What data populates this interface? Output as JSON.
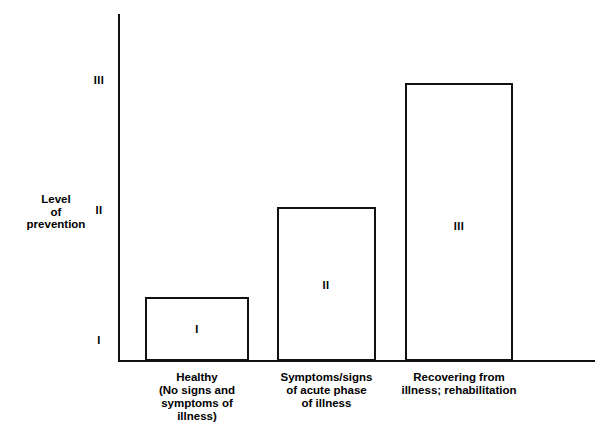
{
  "chart_data": {
    "type": "bar",
    "title": "",
    "subtitle": "",
    "xlabel": "",
    "ylabel": "Level of prevention",
    "ylabel_lines": [
      "Level",
      "of",
      "prevention"
    ],
    "categories": [
      "Healthy (No signs and symptoms of illness)",
      "Symptoms/signs of acute phase of illness",
      "Recovering from illness; rehabilitation"
    ],
    "category_label_lines": [
      [
        "Healthy",
        "(No signs and",
        "symptoms of",
        "illness)"
      ],
      [
        "Symptoms/signs",
        "of acute phase",
        "of illness"
      ],
      [
        "Recovering from",
        "illness; rehabilitation"
      ]
    ],
    "values": [
      1.5,
      2.0,
      3.0
    ],
    "bar_labels": [
      "I",
      "II",
      "III"
    ],
    "ytick_labels": [
      "I",
      "II",
      "III"
    ],
    "ytick_values": [
      1,
      2,
      3
    ],
    "ylim": [
      0.5,
      3.65
    ],
    "grid": false,
    "legend": "none",
    "bar_fill_color": "#ffffff",
    "bar_edge_color": "#111111",
    "axis_color": "#111111",
    "text_color": "#000000",
    "background_color": "#ffffff"
  }
}
